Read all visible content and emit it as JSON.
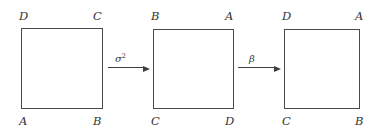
{
  "diagram": {
    "stroke_color": "#4a4a4a",
    "text_color": "#333333",
    "background": "#ffffff",
    "squares": [
      {
        "id": "square-1",
        "top_left_label": "D",
        "top_right_label": "C",
        "bottom_left_label": "A",
        "bottom_right_label": "B"
      },
      {
        "id": "square-2",
        "top_left_label": "B",
        "top_right_label": "A",
        "bottom_left_label": "C",
        "bottom_right_label": "D"
      },
      {
        "id": "square-3",
        "top_left_label": "D",
        "top_right_label": "A",
        "bottom_left_label": "C",
        "bottom_right_label": "B"
      }
    ],
    "arrows": [
      {
        "id": "arrow-1",
        "label_base": "σ",
        "label_exponent": "2",
        "direction": "right"
      },
      {
        "id": "arrow-2",
        "label_base": "β",
        "label_exponent": "",
        "direction": "right"
      }
    ]
  }
}
